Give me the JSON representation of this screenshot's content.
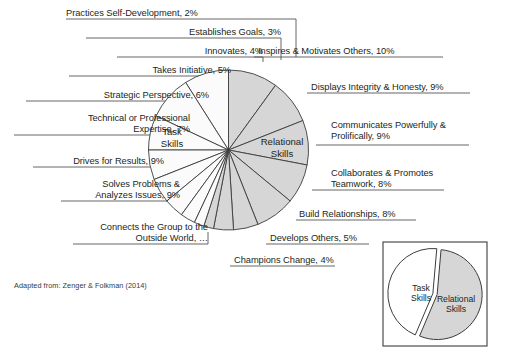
{
  "figure": {
    "title": "",
    "footnote": "Adapted from: Zenger & Folkman (2014)",
    "background": "#ffffff",
    "colors": {
      "task_slice_fill": "#fbfbfb",
      "relational_slice_fill": "#d6d6d6",
      "stroke": "#3c3c3c",
      "text": "#231f20",
      "leader_line": "#555555"
    }
  },
  "chart_data": {
    "type": "pie",
    "title": "",
    "grid": false,
    "legend_position": "inset-bottom-right",
    "start_angle_deg": 0,
    "note": "Main pie starts at 12 o'clock; Relational Skills sweep clockwise (gray), Task Skills sweep counter-clockwise (white).",
    "group_labels": [
      "Task Skills",
      "Relational Skills"
    ],
    "categories": [
      "Inspires & Motivates Others",
      "Displays Integrity & Honesty",
      "Communicates Powerfully & Prolifically",
      "Collaborates & Promotes Teamwork",
      "Build Relationships",
      "Develops Others",
      "Champions Change",
      "Connects the Group to the Outside World",
      "Solves Problems & Analyzes Issues",
      "Drives for Results",
      "Technical or Professional Expertise",
      "Strategic Perspective",
      "Takes Initiative",
      "Innovates",
      "Establishes Goals",
      "Practices Self-Development"
    ],
    "values": [
      10,
      9,
      9,
      8,
      8,
      5,
      4,
      2,
      9,
      9,
      7,
      6,
      5,
      4,
      3,
      2
    ],
    "groups": [
      "Relational Skills",
      "Relational Skills",
      "Relational Skills",
      "Relational Skills",
      "Relational Skills",
      "Relational Skills",
      "Relational Skills",
      "Relational Skills",
      "Task Skills",
      "Task Skills",
      "Task Skills",
      "Task Skills",
      "Task Skills",
      "Task Skills",
      "Task Skills",
      "Task Skills"
    ],
    "xlabel": "",
    "ylabel": "",
    "inset": {
      "type": "pie",
      "categories": [
        "Task Skills",
        "Relational Skills"
      ],
      "values": [
        45,
        55
      ],
      "exploded": true
    }
  },
  "labels": {
    "practices_self_development": "Practices Self-Development, 2%",
    "establishes_goals": "Establishes Goals, 3%",
    "innovates": "Innovates, 4%",
    "takes_initiative": "Takes Initiative, 5%",
    "strategic_perspective": "Strategic Perspective, 6%",
    "technical_expertise": "Technical or Professional\nExpertise, 7%",
    "drives_for_results": "Drives for Results, 9%",
    "solves_problems": "Solves Problems &\nAnalyzes Issues, 9%",
    "connects_group": "Connects the Group to the\nOutside World, …",
    "champions_change": "Champions Change, 4%",
    "develops_others": "Develops Others, 5%",
    "build_relationships": "Build Relationships, 8%",
    "collaborates_teamwork": "Collaborates & Promotes\nTeamwork, 8%",
    "communicates_powerfully": "Communicates Powerfully &\nProlifically, 9%",
    "displays_integrity": "Displays Integrity & Honesty, 9%",
    "inspires_motivates": "Inspires & Motivates Others, 10%",
    "task_skills": "Task\nSkills",
    "relational_skills": "Relational\nSkills"
  },
  "inset_legend": {
    "task_skills": "Task\nSkills",
    "relational_skills": "Relational\nSkills"
  }
}
